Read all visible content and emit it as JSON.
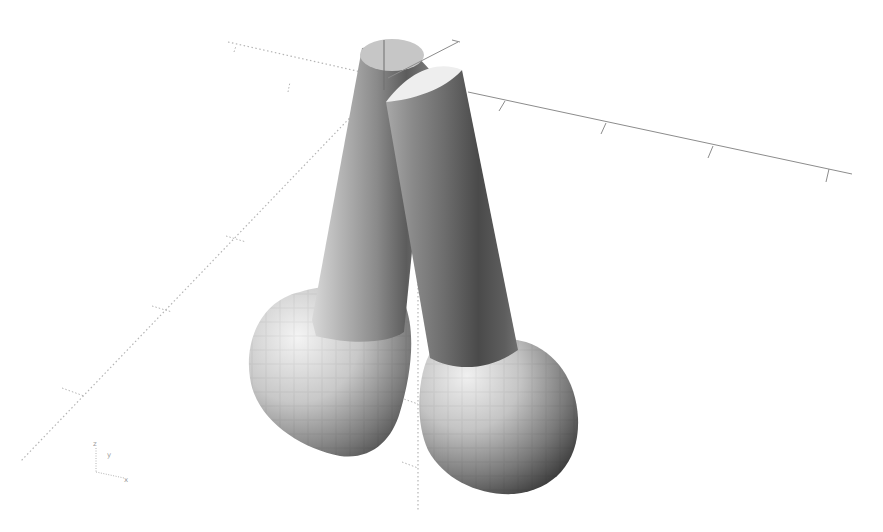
{
  "viewport": {
    "background": "#ffffff",
    "axes": {
      "x_axis_color": "#8c8c8c",
      "dotted_axis_color": "#b4b4b4",
      "positive_x_ticks": 4,
      "negative_ticks_left": 3,
      "negative_ticks_vertical": 2
    },
    "model": {
      "objects": [
        {
          "name": "left-cylinder-with-sphere"
        },
        {
          "name": "right-cylinder-with-sphere"
        }
      ]
    },
    "axis_indicator": {
      "z_label": "z",
      "y_label": "y",
      "x_label": "x"
    }
  }
}
